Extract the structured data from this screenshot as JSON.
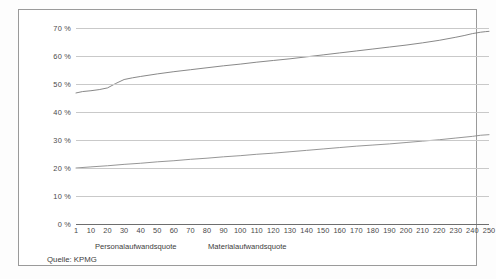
{
  "chart_data": {
    "type": "line",
    "title": "",
    "xlabel": "",
    "ylabel": "",
    "xlim": [
      1,
      250
    ],
    "ylim": [
      0,
      70
    ],
    "grid": true,
    "legend_position": "below-axis",
    "y_ticks": [
      "0 %",
      "10 %",
      "20 %",
      "30 %",
      "40 %",
      "50 %",
      "60 %",
      "70 %"
    ],
    "y_tick_values": [
      0,
      10,
      20,
      30,
      40,
      50,
      60,
      70
    ],
    "x_ticks": [
      "1",
      "10",
      "20",
      "30",
      "40",
      "50",
      "60",
      "70",
      "80",
      "90",
      "100",
      "110",
      "120",
      "130",
      "140",
      "150",
      "160",
      "170",
      "180",
      "190",
      "200",
      "210",
      "220",
      "230",
      "240",
      "250"
    ],
    "x_tick_values": [
      1,
      10,
      20,
      30,
      40,
      50,
      60,
      70,
      80,
      90,
      100,
      110,
      120,
      130,
      140,
      150,
      160,
      170,
      180,
      190,
      200,
      210,
      220,
      230,
      240,
      250
    ],
    "series": [
      {
        "name": "Personalaufwandsquote",
        "color": "#7a7a7a",
        "x": [
          1,
          5,
          10,
          15,
          20,
          25,
          30,
          35,
          40,
          50,
          60,
          70,
          80,
          90,
          100,
          110,
          120,
          130,
          140,
          150,
          160,
          170,
          180,
          190,
          200,
          210,
          220,
          230,
          235,
          240,
          245,
          248,
          250
        ],
        "values": [
          46.8,
          47.3,
          47.6,
          48.0,
          48.6,
          50.2,
          51.6,
          52.2,
          52.7,
          53.6,
          54.4,
          55.1,
          55.8,
          56.5,
          57.1,
          57.8,
          58.4,
          59.0,
          59.7,
          60.4,
          61.1,
          61.8,
          62.5,
          63.2,
          63.9,
          64.7,
          65.6,
          66.7,
          67.3,
          68.0,
          68.5,
          68.7,
          68.8
        ]
      },
      {
        "name": "Materialaufwandsquote",
        "color": "#8a8a8a",
        "x": [
          1,
          10,
          20,
          30,
          40,
          50,
          60,
          70,
          80,
          90,
          100,
          110,
          120,
          130,
          140,
          150,
          160,
          170,
          180,
          190,
          200,
          210,
          220,
          230,
          240,
          245,
          250
        ],
        "values": [
          20.0,
          20.4,
          20.8,
          21.3,
          21.7,
          22.2,
          22.6,
          23.1,
          23.5,
          24.0,
          24.4,
          24.9,
          25.3,
          25.8,
          26.3,
          26.8,
          27.3,
          27.8,
          28.2,
          28.6,
          29.1,
          29.6,
          30.1,
          30.7,
          31.3,
          31.7,
          31.9
        ]
      }
    ]
  },
  "legend": {
    "entries": [
      {
        "label": "Personalaufwandsquote"
      },
      {
        "label": "Materialaufwandsquote"
      }
    ]
  },
  "source": {
    "text": "Quelle: KPMG"
  }
}
